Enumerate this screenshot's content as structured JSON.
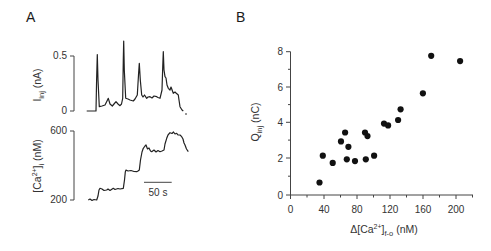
{
  "panels": {
    "A": {
      "label": "A",
      "top_trace": {
        "ylabel_main": "I",
        "ylabel_sub": "inj",
        "ylabel_unit": " (nA)",
        "ticks": [
          "0.5",
          "0"
        ]
      },
      "bottom_trace": {
        "ylabel_pre": "[Ca",
        "ylabel_sup": "2+",
        "ylabel_post": "]",
        "ylabel_sub": "i",
        "ylabel_unit": " (nM)",
        "ticks": [
          "600",
          "200"
        ]
      },
      "scale_bar_label": "50 s"
    },
    "B": {
      "label": "B",
      "ylabel_main": "Q",
      "ylabel_sub": "inj",
      "ylabel_unit": " (nC)",
      "xlabel_pre": "Δ[Ca",
      "xlabel_sup": "2+",
      "xlabel_post": "]",
      "xlabel_sub": "f-o",
      "xlabel_unit": " (nM)",
      "xticks": [
        "0",
        "40",
        "80",
        "120",
        "160",
        "200"
      ],
      "yticks": [
        "0",
        "2",
        "4",
        "6",
        "8"
      ]
    }
  },
  "chart_data": [
    {
      "type": "line",
      "title": "A (top): injected current trace",
      "xlabel": "time",
      "ylabel": "I_inj (nA)",
      "ylim": [
        0,
        0.5
      ],
      "annotations": [
        "scale bar: 50 s"
      ],
      "series": [
        {
          "name": "I_inj",
          "x_seconds": [
            0,
            17,
            18,
            20,
            26,
            33,
            40,
            47,
            50,
            51,
            53,
            60,
            70,
            73,
            75,
            83,
            89,
            102,
            112,
            113,
            115,
            118,
            125,
            130,
            131,
            133
          ],
          "values": [
            0,
            0,
            0.59,
            0.05,
            0.14,
            0.05,
            0.06,
            0.14,
            0.74,
            0.14,
            0.11,
            0.17,
            0.5,
            0.17,
            0.14,
            0.15,
            0.15,
            0.14,
            0.62,
            0.36,
            0.24,
            0.19,
            0.17,
            0.05,
            0,
            0
          ]
        }
      ]
    },
    {
      "type": "line",
      "title": "A (bottom): intracellular calcium trace",
      "xlabel": "time",
      "ylabel": "[Ca2+]i (nM)",
      "ylim": [
        200,
        600
      ],
      "series": [
        {
          "name": "[Ca2+]i",
          "x_seconds": [
            0,
            15,
            21,
            33,
            45,
            63,
            68,
            86,
            91,
            97,
            104,
            122,
            129,
            135,
            147,
            156,
            162,
            168
          ],
          "values": [
            200,
            200,
            268,
            258,
            268,
            268,
            371,
            361,
            371,
            496,
            515,
            477,
            488,
            554,
            586,
            583,
            564,
            477
          ]
        }
      ]
    },
    {
      "type": "scatter",
      "title": "B: charge vs calcium change",
      "xlabel": "Δ[Ca2+]f-o (nM)",
      "ylabel": "Q_inj (nC)",
      "xlim": [
        0,
        220
      ],
      "ylim": [
        0,
        8
      ],
      "x": [
        35,
        39,
        51,
        61,
        66,
        68,
        70,
        78,
        90,
        91,
        93,
        101,
        113,
        118,
        130,
        133,
        160,
        170,
        205
      ],
      "y": [
        0.7,
        2.2,
        1.8,
        3.0,
        3.5,
        2.0,
        2.7,
        1.9,
        3.5,
        2.0,
        3.3,
        2.2,
        4.0,
        3.9,
        4.2,
        4.8,
        5.7,
        7.8,
        7.5
      ]
    }
  ]
}
